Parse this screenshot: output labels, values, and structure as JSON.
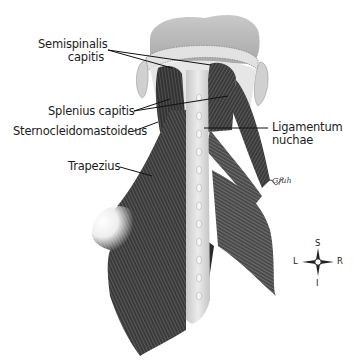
{
  "figure": {
    "labels": [
      {
        "id": "semispinalis-capitis",
        "text_line1": "Semispinalis",
        "text_line2": "capitis"
      },
      {
        "id": "splenius-capitis",
        "text": "Splenius capitis"
      },
      {
        "id": "sternocleidomastoideus",
        "text": "Sternocleidomastoideus"
      },
      {
        "id": "trapezius",
        "text": "Trapezius"
      },
      {
        "id": "ligamentum-nuchae",
        "text_line1": "Ligamentum",
        "text_line2": "nuchae"
      }
    ],
    "compass": {
      "superior": "S",
      "inferior": "I",
      "left": "L",
      "right": "R"
    },
    "signature": "Gfuh"
  },
  "colors": {
    "background": "#ffffff",
    "text": "#1c1c1c",
    "muscle_dark": "#2b2b2b",
    "muscle_mid": "#6a6a6a",
    "bone": "#d8d8d8",
    "skull": "#bdbdbd"
  }
}
